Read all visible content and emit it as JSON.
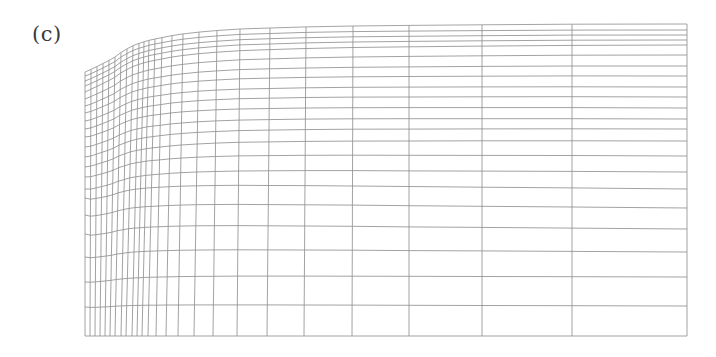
{
  "figure": {
    "panel_label": "(c)"
  },
  "mesh": {
    "colors": {
      "line": "#8a8a8a",
      "background": "#ffffff",
      "label": "#3a3a3a"
    },
    "domain": {
      "x_left": 85,
      "x_right": 687,
      "y_bottom": 336
    },
    "top_boundary": [
      [
        85,
        72
      ],
      [
        92,
        69
      ],
      [
        100,
        65
      ],
      [
        108,
        61
      ],
      [
        115,
        57
      ],
      [
        120,
        53
      ],
      [
        125,
        50
      ],
      [
        132,
        46
      ],
      [
        140,
        43
      ],
      [
        150,
        40
      ],
      [
        160,
        38
      ],
      [
        175,
        35
      ],
      [
        190,
        33
      ],
      [
        210,
        31
      ],
      [
        240,
        29
      ],
      [
        270,
        28
      ],
      [
        300,
        27
      ],
      [
        350,
        26
      ],
      [
        400,
        25.5
      ],
      [
        450,
        25
      ],
      [
        520,
        24.5
      ],
      [
        600,
        24
      ],
      [
        687,
        24
      ]
    ],
    "column_x_bottom": [
      85,
      90,
      95,
      100,
      105,
      110,
      115,
      121,
      126,
      132,
      137,
      142,
      148,
      156,
      166,
      178,
      194,
      213,
      237,
      267,
      304,
      352,
      409,
      482,
      572,
      687
    ],
    "column_top_shift": [
      0,
      1,
      2,
      3,
      4,
      5,
      6,
      6,
      7,
      7,
      7,
      7,
      7,
      6,
      6,
      5,
      5,
      4,
      3,
      3,
      2,
      1,
      0,
      0,
      0,
      0
    ],
    "row_y_left": [
      72,
      76,
      81,
      86,
      92,
      99,
      106,
      113,
      121,
      129,
      137,
      147,
      157,
      167,
      177,
      189,
      198,
      215,
      234,
      257,
      282,
      307,
      336
    ],
    "row_y_right": [
      24,
      30,
      35,
      40,
      45,
      55,
      66,
      76,
      87,
      97,
      108,
      119,
      129,
      141,
      156,
      172,
      189,
      208,
      229,
      252,
      277,
      306,
      336
    ]
  }
}
